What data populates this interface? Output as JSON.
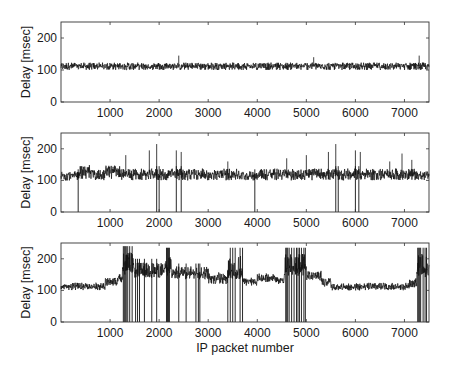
{
  "figure": {
    "xlabel": "IP packet number",
    "background": "#ffffff",
    "line_color": "#111111"
  },
  "chart_data": [
    {
      "type": "line",
      "panel": "top",
      "title": "",
      "xlabel": "",
      "ylabel": "Delay [msec]",
      "xlim": [
        0,
        7500
      ],
      "ylim": [
        0,
        250
      ],
      "xticks": [
        1000,
        2000,
        3000,
        4000,
        5000,
        6000,
        7000
      ],
      "yticks": [
        0,
        100,
        200
      ],
      "grid": false,
      "description": "Steady delay band ~100-125 msec across all packets, occasional spikes to ~145 msec, no drops",
      "series": [
        {
          "name": "delay",
          "baseline": 112,
          "band": [
            100,
            128
          ],
          "segments": [
            {
              "x0": 0,
              "x1": 7500,
              "level": 112,
              "band": [
                100,
                128
              ]
            }
          ],
          "spikes": [
            {
              "x": 2400,
              "y": 145
            },
            {
              "x": 7300,
              "y": 145
            },
            {
              "x": 5150,
              "y": 140
            }
          ],
          "drops": []
        }
      ]
    },
    {
      "type": "line",
      "panel": "middle",
      "title": "",
      "xlabel": "",
      "ylabel": "Delay [msec]",
      "xlim": [
        0,
        7500
      ],
      "ylim": [
        0,
        250
      ],
      "xticks": [
        1000,
        2000,
        3000,
        4000,
        5000,
        6000,
        7000
      ],
      "yticks": [
        0,
        100,
        200
      ],
      "grid": false,
      "description": "Delay band ~100-140 msec with frequent spikes up to ~215 msec and occasional drops to 0",
      "series": [
        {
          "name": "delay",
          "baseline": 118,
          "band": [
            100,
            145
          ],
          "segments": [
            {
              "x0": 0,
              "x1": 350,
              "level": 115,
              "band": [
                100,
                135
              ]
            },
            {
              "x0": 350,
              "x1": 600,
              "level": 130,
              "band": [
                105,
                160
              ]
            },
            {
              "x0": 600,
              "x1": 900,
              "level": 118,
              "band": [
                100,
                140
              ]
            },
            {
              "x0": 900,
              "x1": 1200,
              "level": 130,
              "band": [
                105,
                155
              ]
            },
            {
              "x0": 1200,
              "x1": 3700,
              "level": 120,
              "band": [
                100,
                145
              ]
            },
            {
              "x0": 3700,
              "x1": 4000,
              "level": 115,
              "band": [
                100,
                135
              ]
            },
            {
              "x0": 4000,
              "x1": 7200,
              "level": 120,
              "band": [
                100,
                145
              ]
            },
            {
              "x0": 7200,
              "x1": 7500,
              "level": 115,
              "band": [
                100,
                135
              ]
            }
          ],
          "spikes": [
            {
              "x": 1320,
              "y": 180
            },
            {
              "x": 1800,
              "y": 195
            },
            {
              "x": 1950,
              "y": 215
            },
            {
              "x": 2350,
              "y": 195
            },
            {
              "x": 2450,
              "y": 190
            },
            {
              "x": 3400,
              "y": 160
            },
            {
              "x": 4600,
              "y": 170
            },
            {
              "x": 5000,
              "y": 180
            },
            {
              "x": 5450,
              "y": 190
            },
            {
              "x": 5600,
              "y": 215
            },
            {
              "x": 6000,
              "y": 195
            },
            {
              "x": 6100,
              "y": 190
            },
            {
              "x": 6700,
              "y": 160
            },
            {
              "x": 6950,
              "y": 185
            },
            {
              "x": 7150,
              "y": 165
            }
          ],
          "drops": [
            350,
            1950,
            2000,
            2350,
            2450,
            3950,
            5600,
            5650,
            6000,
            6070
          ]
        }
      ]
    },
    {
      "type": "line",
      "panel": "bottom",
      "title": "",
      "xlabel": "IP packet number",
      "ylabel": "Delay [msec]",
      "xlim": [
        0,
        7500
      ],
      "ylim": [
        0,
        250
      ],
      "xticks": [
        1000,
        2000,
        3000,
        4000,
        5000,
        6000,
        7000
      ],
      "yticks": [
        0,
        100,
        200
      ],
      "grid": false,
      "description": "Delay rises from ~110 to ~160-175 msec during congestion periods (1200-3700, 4550-5000, 7250-7500) with many drops to 0; ~120-140 between, ~100-110 during 5500-7100",
      "series": [
        {
          "name": "delay",
          "segments": [
            {
              "x0": 0,
              "x1": 900,
              "level": 112,
              "band": [
                100,
                130
              ]
            },
            {
              "x0": 900,
              "x1": 1150,
              "level": 128,
              "band": [
                115,
                145
              ]
            },
            {
              "x0": 1150,
              "x1": 1250,
              "level": 140,
              "band": [
                125,
                160
              ]
            },
            {
              "x0": 1250,
              "x1": 1500,
              "level": 175,
              "band": [
                150,
                240
              ]
            },
            {
              "x0": 1500,
              "x1": 2100,
              "level": 160,
              "band": [
                140,
                200
              ]
            },
            {
              "x0": 2100,
              "x1": 2250,
              "level": 170,
              "band": [
                145,
                235
              ]
            },
            {
              "x0": 2250,
              "x1": 3000,
              "level": 155,
              "band": [
                135,
                185
              ]
            },
            {
              "x0": 3000,
              "x1": 3400,
              "level": 140,
              "band": [
                120,
                165
              ]
            },
            {
              "x0": 3400,
              "x1": 3700,
              "level": 160,
              "band": [
                135,
                235
              ]
            },
            {
              "x0": 3700,
              "x1": 4000,
              "level": 130,
              "band": [
                115,
                145
              ]
            },
            {
              "x0": 4000,
              "x1": 4400,
              "level": 140,
              "band": [
                125,
                160
              ]
            },
            {
              "x0": 4400,
              "x1": 4550,
              "level": 130,
              "band": [
                120,
                145
              ]
            },
            {
              "x0": 4550,
              "x1": 5000,
              "level": 175,
              "band": [
                145,
                235
              ]
            },
            {
              "x0": 5000,
              "x1": 5300,
              "level": 145,
              "band": [
                130,
                170
              ]
            },
            {
              "x0": 5300,
              "x1": 5500,
              "level": 125,
              "band": [
                110,
                145
              ]
            },
            {
              "x0": 5500,
              "x1": 7100,
              "level": 110,
              "band": [
                100,
                130
              ]
            },
            {
              "x0": 7100,
              "x1": 7250,
              "level": 125,
              "band": [
                110,
                145
              ]
            },
            {
              "x0": 7250,
              "x1": 7500,
              "level": 170,
              "band": [
                140,
                235
              ]
            }
          ],
          "drops": [
            1270,
            1290,
            1310,
            1330,
            1360,
            1400,
            1450,
            1520,
            1560,
            1600,
            1700,
            1850,
            1950,
            2150,
            2170,
            2190,
            2210,
            2400,
            2550,
            2750,
            2800,
            2830,
            3400,
            3450,
            3500,
            3550,
            3650,
            3700,
            4580,
            4600,
            4620,
            4650,
            4700,
            4750,
            4800,
            4830,
            4860,
            4900,
            4950,
            4980,
            7270,
            7290,
            7310,
            7330,
            7380,
            7420,
            7450
          ]
        }
      ]
    }
  ]
}
